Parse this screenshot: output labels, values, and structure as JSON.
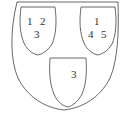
{
  "diagram": {
    "type": "shield-partition",
    "outer_shield": {
      "label": "outer-shield"
    },
    "inner_shields": [
      {
        "position": "top-left",
        "numbers": [
          "1",
          "2",
          "3"
        ]
      },
      {
        "position": "top-right",
        "numbers": [
          "1",
          "4",
          "5"
        ]
      },
      {
        "position": "bottom-center",
        "numbers": [
          "3"
        ]
      }
    ],
    "colors": {
      "stroke": "#555555",
      "text": "#333333",
      "background": "#ffffff"
    }
  }
}
